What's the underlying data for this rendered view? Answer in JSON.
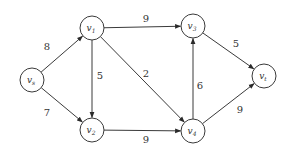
{
  "diagram": {
    "type": "directed-weighted-graph",
    "nodes": [
      {
        "id": "vs",
        "base": "v",
        "sub": "s",
        "x": 32,
        "y": 80
      },
      {
        "id": "v1",
        "base": "v",
        "sub": "1",
        "x": 92,
        "y": 28
      },
      {
        "id": "v2",
        "base": "v",
        "sub": "2",
        "x": 92,
        "y": 130
      },
      {
        "id": "v3",
        "base": "v",
        "sub": "3",
        "x": 193,
        "y": 26
      },
      {
        "id": "v4",
        "base": "v",
        "sub": "4",
        "x": 193,
        "y": 131
      },
      {
        "id": "vt",
        "base": "v",
        "sub": "t",
        "x": 264,
        "y": 76
      }
    ],
    "edges": [
      {
        "from": "vs",
        "to": "v1",
        "weight": "8",
        "lx": 47,
        "ly": 50
      },
      {
        "from": "vs",
        "to": "v2",
        "weight": "7",
        "lx": 47,
        "ly": 116
      },
      {
        "from": "v1",
        "to": "v3",
        "weight": "9",
        "lx": 146,
        "ly": 22
      },
      {
        "from": "v1",
        "to": "v2",
        "weight": "5",
        "lx": 100,
        "ly": 79
      },
      {
        "from": "v1",
        "to": "v4",
        "weight": "2",
        "lx": 146,
        "ly": 77
      },
      {
        "from": "v2",
        "to": "v4",
        "weight": "9",
        "lx": 146,
        "ly": 143
      },
      {
        "from": "v4",
        "to": "v3",
        "weight": "6",
        "lx": 200,
        "ly": 89
      },
      {
        "from": "v3",
        "to": "vt",
        "weight": "5",
        "lx": 236,
        "ly": 47
      },
      {
        "from": "v4",
        "to": "vt",
        "weight": "9",
        "lx": 240,
        "ly": 113
      }
    ],
    "node_radius": 12,
    "stroke_color": "#3a3a3a"
  }
}
